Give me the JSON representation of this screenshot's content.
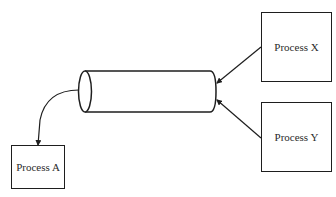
{
  "diagram": {
    "type": "message-queue-flow",
    "colors": {
      "stroke": "#1e1e1e",
      "text": "#2a2a2a",
      "background": "#ffffff"
    },
    "nodes": [
      {
        "id": "process_x",
        "label": "Process X",
        "shape": "box"
      },
      {
        "id": "process_y",
        "label": "Process Y",
        "shape": "box"
      },
      {
        "id": "queue",
        "label": "",
        "shape": "cylinder"
      },
      {
        "id": "process_a",
        "label": "Process A",
        "shape": "box"
      }
    ],
    "edges": [
      {
        "from": "process_x",
        "to": "queue",
        "arrow": "end"
      },
      {
        "from": "process_y",
        "to": "queue",
        "arrow": "end"
      },
      {
        "from": "queue",
        "to": "process_a",
        "arrow": "end"
      }
    ]
  }
}
